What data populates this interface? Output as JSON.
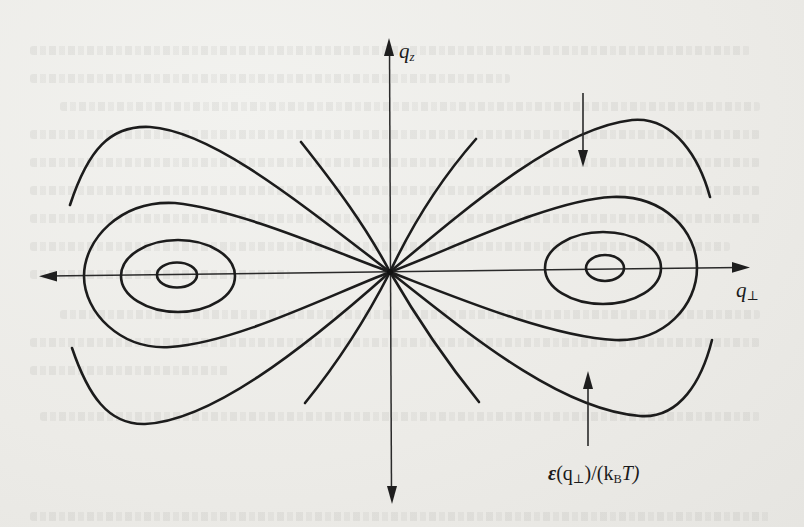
{
  "figure": {
    "axes": {
      "vertical": {
        "label_main": "q",
        "label_sub": "z",
        "direction": "both"
      },
      "horizontal": {
        "label_main": "q",
        "label_sub": "⊥",
        "direction": "both"
      }
    },
    "annotation": {
      "symbol": "ε",
      "arg_open": "(q",
      "arg_sub": "⊥",
      "arg_close": ")/(k",
      "kb_sub": "B",
      "tail": "T)"
    },
    "pointer_arrows": [
      {
        "name": "down-pointer",
        "x": 583,
        "y_from": 93,
        "y_to": 166
      },
      {
        "name": "up-pointer",
        "x": 588,
        "y_from": 446,
        "y_to": 372
      }
    ],
    "contours": {
      "inner_ellipses": [
        {
          "side": "left",
          "cx": 177,
          "cy": 275,
          "rx": 20,
          "ry": 12
        },
        {
          "side": "right",
          "cx": 605,
          "cy": 268,
          "rx": 19,
          "ry": 13
        }
      ],
      "middle_ellipses": [
        {
          "side": "left",
          "cx": 178,
          "cy": 276,
          "rx": 57,
          "ry": 36
        },
        {
          "side": "right",
          "cx": 603,
          "cy": 268,
          "rx": 58,
          "ry": 36
        }
      ]
    },
    "colors": {
      "ink": "#1c1c1c",
      "paper": "#ecebe7"
    }
  }
}
